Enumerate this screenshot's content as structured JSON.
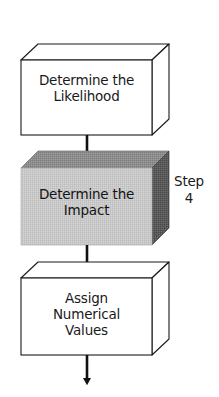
{
  "diagram": {
    "type": "flowchart-3d-boxes",
    "colors": {
      "outline": "#1a1a1a",
      "box_fill_white": "#ffffff",
      "highlight_front": "#c9c9c9",
      "highlight_top": "#8d8d8d",
      "highlight_side": "#5a5a5a",
      "text": "#1a1a1a",
      "background": "#ffffff"
    },
    "nodes": [
      {
        "id": "determine-likelihood",
        "shape": "cuboid",
        "highlighted": false,
        "lines": [
          "Determine the",
          "Likelihood"
        ]
      },
      {
        "id": "determine-impact",
        "shape": "cuboid",
        "highlighted": true,
        "lines": [
          "Determine the",
          "Impact"
        ]
      },
      {
        "id": "assign-numerical-values",
        "shape": "cuboid",
        "highlighted": false,
        "lines": [
          "Assign",
          "Numerical",
          "Values"
        ]
      }
    ],
    "annotation": {
      "id": "step-4",
      "lines": [
        "Step",
        "4"
      ]
    },
    "connectors": [
      {
        "id": "arrow-likelihood-to-impact",
        "from": "determine-likelihood",
        "to": "determine-impact",
        "direction": "down"
      },
      {
        "id": "arrow-impact-to-assign",
        "from": "determine-impact",
        "to": "assign-numerical-values",
        "direction": "down"
      },
      {
        "id": "arrow-assign-to-next",
        "from": "assign-numerical-values",
        "to": "",
        "direction": "down"
      }
    ]
  }
}
